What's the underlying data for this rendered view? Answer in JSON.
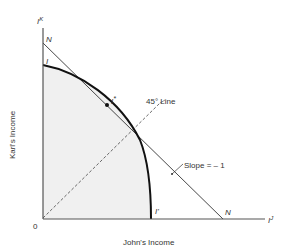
{
  "figure": {
    "x_axis_label": "John's Income",
    "y_axis_label": "Karl's Income",
    "x_axis_symbol": "I",
    "x_axis_symbol_sup": "J",
    "y_axis_symbol": "I",
    "y_axis_symbol_sup": "K",
    "origin_label": "0",
    "curve_label_top": "I",
    "curve_label_bottom": "I'",
    "tangent_point_label": "I",
    "tangent_point_sup": "*",
    "line_label_top": "N",
    "line_label_bottom": "N",
    "annotation_45": "45° Line",
    "annotation_slope": "Slope = – 1"
  },
  "colors": {
    "shade": "#f0f0f0",
    "line": "#333333",
    "curve": "#111111"
  }
}
